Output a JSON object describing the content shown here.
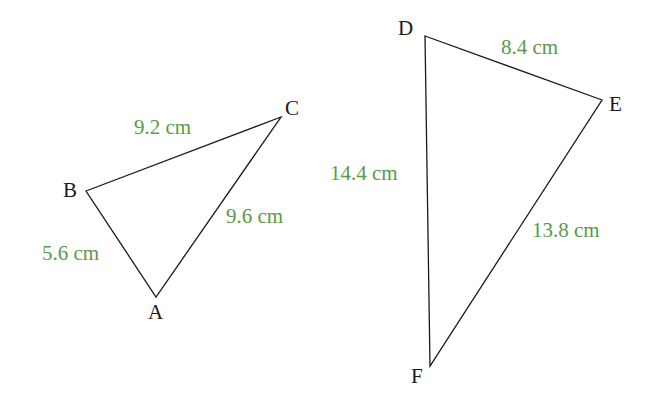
{
  "colors": {
    "line": "#1a1a1a",
    "measure": "#5a9a48"
  },
  "triangle_abc": {
    "vertices": {
      "A": "A",
      "B": "B",
      "C": "C"
    },
    "sides": {
      "BC": "9.2 cm",
      "AC": "9.6 cm",
      "AB": "5.6 cm"
    }
  },
  "triangle_def": {
    "vertices": {
      "D": "D",
      "E": "E",
      "F": "F"
    },
    "sides": {
      "DE": "8.4 cm",
      "DF": "14.4 cm",
      "EF": "13.8 cm"
    }
  }
}
